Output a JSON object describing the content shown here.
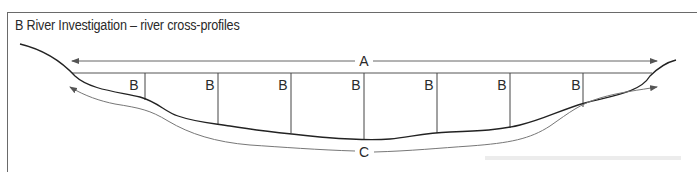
{
  "figure": {
    "title": "B  River Investigation – river cross-profiles",
    "labels": {
      "width_arrow": "A",
      "depth_marker": "B",
      "wetted_perimeter_arrow": "C"
    },
    "depth_markers": [
      {
        "label": "B"
      },
      {
        "label": "B"
      },
      {
        "label": "B"
      },
      {
        "label": "B"
      },
      {
        "label": "B"
      },
      {
        "label": "B"
      },
      {
        "label": "B"
      }
    ],
    "colors": {
      "line": "#2a2a2a",
      "arrow": "#6a6a6a",
      "frame": "#6a6a6a"
    }
  }
}
